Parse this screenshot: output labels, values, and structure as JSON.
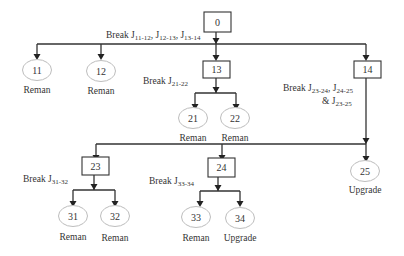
{
  "diagram": {
    "nodes": {
      "n0": {
        "id": "0",
        "shape": "box"
      },
      "n11": {
        "id": "11",
        "shape": "ellipse",
        "caption": "Reman"
      },
      "n12": {
        "id": "12",
        "shape": "ellipse",
        "caption": "Reman"
      },
      "n13": {
        "id": "13",
        "shape": "box"
      },
      "n14": {
        "id": "14",
        "shape": "box"
      },
      "n21": {
        "id": "21",
        "shape": "ellipse",
        "caption": "Reman"
      },
      "n22": {
        "id": "22",
        "shape": "ellipse",
        "caption": "Reman"
      },
      "n23": {
        "id": "23",
        "shape": "box"
      },
      "n24": {
        "id": "24",
        "shape": "box"
      },
      "n25": {
        "id": "25",
        "shape": "ellipse",
        "caption": "Upgrade"
      },
      "n31": {
        "id": "31",
        "shape": "ellipse",
        "caption": "Reman"
      },
      "n32": {
        "id": "32",
        "shape": "ellipse",
        "caption": "Reman"
      },
      "n33": {
        "id": "33",
        "shape": "ellipse",
        "caption": "Reman"
      },
      "n34": {
        "id": "34",
        "shape": "ellipse",
        "caption": "Upgrade"
      }
    },
    "edges": [
      {
        "from": "0",
        "to": "11"
      },
      {
        "from": "0",
        "to": "12"
      },
      {
        "from": "0",
        "to": "13"
      },
      {
        "from": "0",
        "to": "14"
      },
      {
        "from": "13",
        "to": "21"
      },
      {
        "from": "13",
        "to": "22"
      },
      {
        "from": "14",
        "to": "23"
      },
      {
        "from": "14",
        "to": "24"
      },
      {
        "from": "14",
        "to": "25"
      },
      {
        "from": "23",
        "to": "31"
      },
      {
        "from": "23",
        "to": "32"
      },
      {
        "from": "24",
        "to": "33"
      },
      {
        "from": "24",
        "to": "34"
      }
    ],
    "breaks": {
      "b0": {
        "prefix": "Break ",
        "items": [
          {
            "j": "J",
            "sub": "11-12"
          },
          {
            "j": ", J",
            "sub": "12-13"
          },
          {
            "j": ", J",
            "sub": "13-14"
          }
        ]
      },
      "b13": {
        "prefix": "Break J",
        "sub": "21-22"
      },
      "b14": {
        "line1_prefix": "Break  J",
        "line1_sub1": "23-24",
        "line1_mid": ", J",
        "line1_sub2": "24-25",
        "line2_prefix": "& J",
        "line2_sub": "23-25"
      },
      "b23": {
        "prefix": "Break J",
        "sub": "31-32"
      },
      "b24": {
        "prefix": "Break J",
        "sub": "33-34"
      }
    }
  }
}
